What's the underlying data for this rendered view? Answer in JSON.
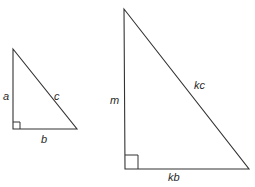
{
  "diagram": {
    "small_triangle": {
      "labels": {
        "vertical_leg": "a",
        "hypotenuse": "c",
        "horizontal_leg": "b"
      }
    },
    "large_triangle": {
      "labels": {
        "vertical_leg": "m",
        "hypotenuse": "kc",
        "horizontal_leg": "kb"
      }
    },
    "colors": {
      "stroke": "#333333",
      "background": "#ffffff"
    }
  }
}
